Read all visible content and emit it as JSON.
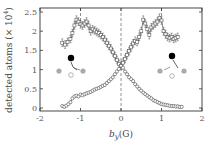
{
  "chart_data": {
    "type": "scatter",
    "title": "",
    "xlabel": "b_y (G)",
    "xlabel_main": "b",
    "xlabel_sub": "y",
    "xlabel_unit": "(G)",
    "ylabel": "detected atoms (× 10⁴)",
    "ylabel_text": "detected atoms (× 10",
    "ylabel_sup": "4",
    "ylabel_close": ")",
    "xlim": [
      -2,
      2
    ],
    "ylim": [
      0,
      2.5
    ],
    "xticks": [
      -2,
      -1,
      0,
      1,
      2
    ],
    "xtick_labels": [
      "-2",
      "-1",
      "0",
      "1",
      "2"
    ],
    "yticks": [
      0,
      0.5,
      1,
      1.5,
      2,
      2.5
    ],
    "ytick_labels": [
      "0",
      "0.5",
      "1",
      "1.5",
      "2",
      "2.5"
    ],
    "grid": false,
    "dashed_vlines": [
      {
        "x": 0,
        "span": "full"
      },
      {
        "x": -1,
        "span": "top"
      },
      {
        "x": 1,
        "span": "top"
      }
    ],
    "series": [
      {
        "name": "upper (squares)",
        "marker": "square",
        "error_bars": true,
        "x": [
          -1.45,
          -1.38,
          -1.32,
          -1.25,
          -1.2,
          -1.15,
          -1.1,
          -1.05,
          -1.0,
          -0.95,
          -0.9,
          -0.85,
          -0.8,
          -0.75,
          -0.7,
          -0.65,
          -0.6,
          -0.55,
          -0.5,
          -0.45,
          -0.4,
          -0.35,
          -0.3,
          -0.25,
          -0.2,
          -0.15,
          -0.1,
          -0.05,
          0.0,
          0.05,
          0.1,
          0.15,
          0.2,
          0.25,
          0.3,
          0.35,
          0.4,
          0.45,
          0.5,
          0.55,
          0.6,
          0.65,
          0.7,
          0.75,
          0.8,
          0.85,
          0.9,
          0.95,
          1.0,
          1.05,
          1.1,
          1.15,
          1.2,
          1.25,
          1.3,
          1.35,
          1.4
        ],
        "y": [
          1.7,
          1.65,
          1.72,
          1.8,
          1.95,
          2.15,
          2.3,
          2.25,
          2.18,
          2.15,
          2.2,
          2.25,
          2.15,
          2.0,
          2.05,
          2.02,
          1.98,
          1.95,
          1.9,
          1.85,
          1.78,
          1.7,
          1.62,
          1.55,
          1.45,
          1.35,
          1.25,
          1.15,
          1.1,
          1.18,
          1.28,
          1.38,
          1.48,
          1.58,
          1.68,
          1.75,
          1.72,
          1.85,
          2.0,
          2.3,
          2.2,
          2.05,
          1.9,
          2.1,
          2.15,
          2.2,
          2.25,
          2.35,
          2.28,
          2.0,
          1.92,
          1.85,
          1.82,
          1.85,
          1.8,
          1.82,
          1.85
        ],
        "y_err": 0.1
      },
      {
        "name": "lower (circles)",
        "marker": "circle",
        "error_bars": true,
        "x": [
          -1.45,
          -1.4,
          -1.35,
          -1.3,
          -1.25,
          -1.2,
          -1.15,
          -1.1,
          -1.05,
          -1.0,
          -0.95,
          -0.9,
          -0.85,
          -0.8,
          -0.75,
          -0.7,
          -0.65,
          -0.6,
          -0.55,
          -0.5,
          -0.45,
          -0.4,
          -0.35,
          -0.3,
          -0.25,
          -0.2,
          -0.15,
          -0.1,
          -0.05,
          0.0,
          0.05,
          0.1,
          0.15,
          0.2,
          0.25,
          0.3,
          0.35,
          0.4,
          0.45,
          0.5,
          0.55,
          0.6,
          0.65,
          0.7,
          0.75,
          0.8,
          0.85,
          0.9,
          0.95,
          1.0,
          1.05,
          1.1,
          1.15,
          1.2,
          1.25,
          1.3,
          1.35,
          1.4,
          1.45,
          1.5
        ],
        "y": [
          0.05,
          0.03,
          0.06,
          0.1,
          0.15,
          0.25,
          0.3,
          0.32,
          0.3,
          0.35,
          0.33,
          0.36,
          0.38,
          0.4,
          0.42,
          0.45,
          0.48,
          0.5,
          0.52,
          0.55,
          0.58,
          0.6,
          0.65,
          0.7,
          0.75,
          0.8,
          0.88,
          0.95,
          1.02,
          1.1,
          1.05,
          0.95,
          0.88,
          0.8,
          0.75,
          0.7,
          0.62,
          0.56,
          0.5,
          0.45,
          0.4,
          0.36,
          0.32,
          0.28,
          0.25,
          0.2,
          0.18,
          0.15,
          0.13,
          0.1,
          0.09,
          0.08,
          0.07,
          0.06,
          0.05,
          0.05,
          0.04,
          0.04,
          0.03,
          0.03
        ],
        "y_err": 0.03
      }
    ],
    "insets": [
      {
        "name": "left-level-diagram",
        "position": "left",
        "description": "black dot above, two grey dots below with arrow to right grey dot and open circle"
      },
      {
        "name": "right-level-diagram",
        "position": "right",
        "description": "black dot above, two grey dots below with arrow to left grey dot and open circle"
      }
    ],
    "colors": {
      "data": "#555555",
      "axis": "#333333",
      "dashed": "#777777",
      "dot_black": "#000000",
      "dot_grey": "#aaaaaa"
    }
  }
}
